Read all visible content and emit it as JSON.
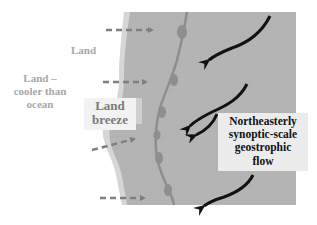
{
  "diagram": {
    "labels": {
      "land": "Land",
      "land_cooler_line1": "Land –",
      "land_cooler_line2": "cooler than",
      "land_cooler_line3": "ocean",
      "land_breeze_line1": "Land",
      "land_breeze_line2": "breeze",
      "flow_line1": "Northeasterly",
      "flow_line2": "synoptic-scale",
      "flow_line3": "geostrophic",
      "flow_line4": "flow"
    },
    "colors": {
      "ocean": "#b4b4b4",
      "coast_fringe": "#d6d6d6",
      "front_line": "#8e8e8e",
      "land_breeze_arrow": "#7f7f7f",
      "geostrophic_arrow": "#111111",
      "land_text": "#a8a8a8",
      "land_breeze_text": "#7a7a7a",
      "flow_text": "#111111"
    },
    "elements": {
      "land_breeze_arrows": 4,
      "geostrophic_arrows": 4,
      "front_bulges": 6
    }
  }
}
